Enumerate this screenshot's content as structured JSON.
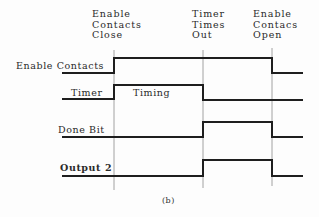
{
  "diagram": {
    "caption": "(b)",
    "events": [
      {
        "lines": [
          "Enable",
          "Contacts",
          "Close"
        ],
        "x": 114
      },
      {
        "lines": [
          "Timer",
          "Times",
          "Out"
        ],
        "x": 203
      },
      {
        "lines": [
          "Enable",
          "Contacs",
          "Open"
        ],
        "x": 272
      }
    ],
    "signals": [
      {
        "label": "Enable Contacts"
      },
      {
        "label": "Timer",
        "annotation": "Timing"
      },
      {
        "label": "Done Bit"
      },
      {
        "label": "Output 2"
      }
    ],
    "colors": {
      "line": "#1e1e1e",
      "guide": "#8a8a8a",
      "text": "#2a2a2a"
    }
  }
}
